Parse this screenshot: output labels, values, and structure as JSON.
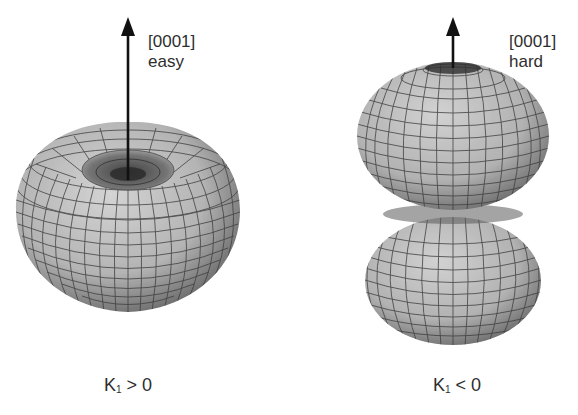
{
  "figure": {
    "panels": [
      {
        "id": "left",
        "axis_label": "[0001]",
        "axis_note": "easy",
        "caption_symbol": "K",
        "caption_subscript": "1",
        "caption_relation": " > 0",
        "shape": "torus-like (energy minimum along axis)"
      },
      {
        "id": "right",
        "axis_label": "[0001]",
        "axis_note": "hard",
        "caption_symbol": "K",
        "caption_subscript": "1",
        "caption_relation": " < 0",
        "shape": "two stacked lobes (energy maximum along axis)"
      }
    ],
    "colors": {
      "surface_light": "#c8c8c8",
      "surface_dark": "#555555",
      "grid": "#3a3a3a",
      "arrow": "#111111",
      "text": "#2e2e2e"
    }
  }
}
